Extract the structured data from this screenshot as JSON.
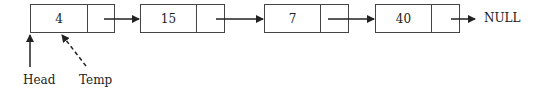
{
  "diagram": {
    "type": "singly-linked-list",
    "nodes": [
      {
        "value": "4"
      },
      {
        "value": "15"
      },
      {
        "value": "7"
      },
      {
        "value": "40"
      }
    ],
    "terminator": "NULL",
    "pointers": [
      {
        "label": "Head",
        "style": "solid",
        "target_node": 0
      },
      {
        "label": "Temp",
        "style": "dashed",
        "target_node": 0
      }
    ]
  }
}
